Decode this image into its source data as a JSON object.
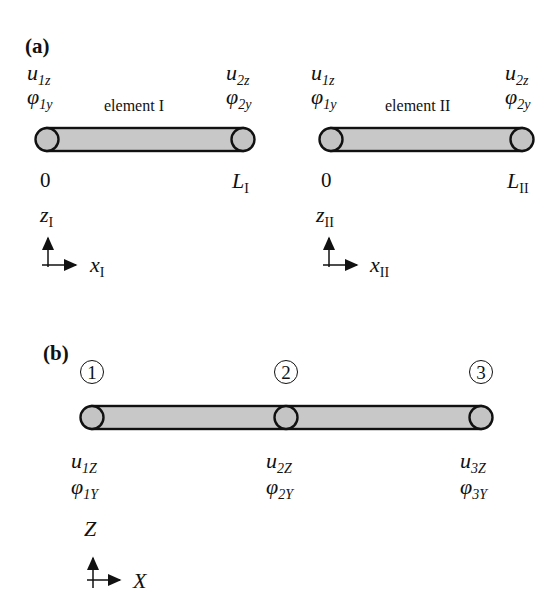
{
  "panel_a": {
    "label": "(a)",
    "element_1": {
      "name": "element I",
      "left_dofs": {
        "u_base": "u",
        "u_sub": "1z",
        "phi_base": "φ",
        "phi_sub": "1y"
      },
      "right_dofs": {
        "u_base": "u",
        "u_sub": "2z",
        "phi_base": "φ",
        "phi_sub": "2y"
      },
      "start_coord": "0",
      "end_coord_base": "L",
      "end_coord_sub": "I",
      "axis_z_base": "z",
      "axis_z_sub": "I",
      "axis_x_base": "x",
      "axis_x_sub": "I"
    },
    "element_2": {
      "name": "element II",
      "left_dofs": {
        "u_base": "u",
        "u_sub": "1z",
        "phi_base": "φ",
        "phi_sub": "1y"
      },
      "right_dofs": {
        "u_base": "u",
        "u_sub": "2z",
        "phi_base": "φ",
        "phi_sub": "2y"
      },
      "start_coord": "0",
      "end_coord_base": "L",
      "end_coord_sub": "II",
      "axis_z_base": "z",
      "axis_z_sub": "II",
      "axis_x_base": "x",
      "axis_x_sub": "II"
    }
  },
  "panel_b": {
    "label": "(b)",
    "nodes": [
      {
        "number": "1",
        "u_base": "u",
        "u_sub": "1Z",
        "phi_base": "φ",
        "phi_sub": "1Y"
      },
      {
        "number": "2",
        "u_base": "u",
        "u_sub": "2Z",
        "phi_base": "φ",
        "phi_sub": "2Y"
      },
      {
        "number": "3",
        "u_base": "u",
        "u_sub": "3Z",
        "phi_base": "φ",
        "phi_sub": "3Y"
      }
    ],
    "axis_z": "Z",
    "axis_x": "X"
  },
  "colors": {
    "bar_fill": "#c8c8c8",
    "stroke": "#111111"
  }
}
